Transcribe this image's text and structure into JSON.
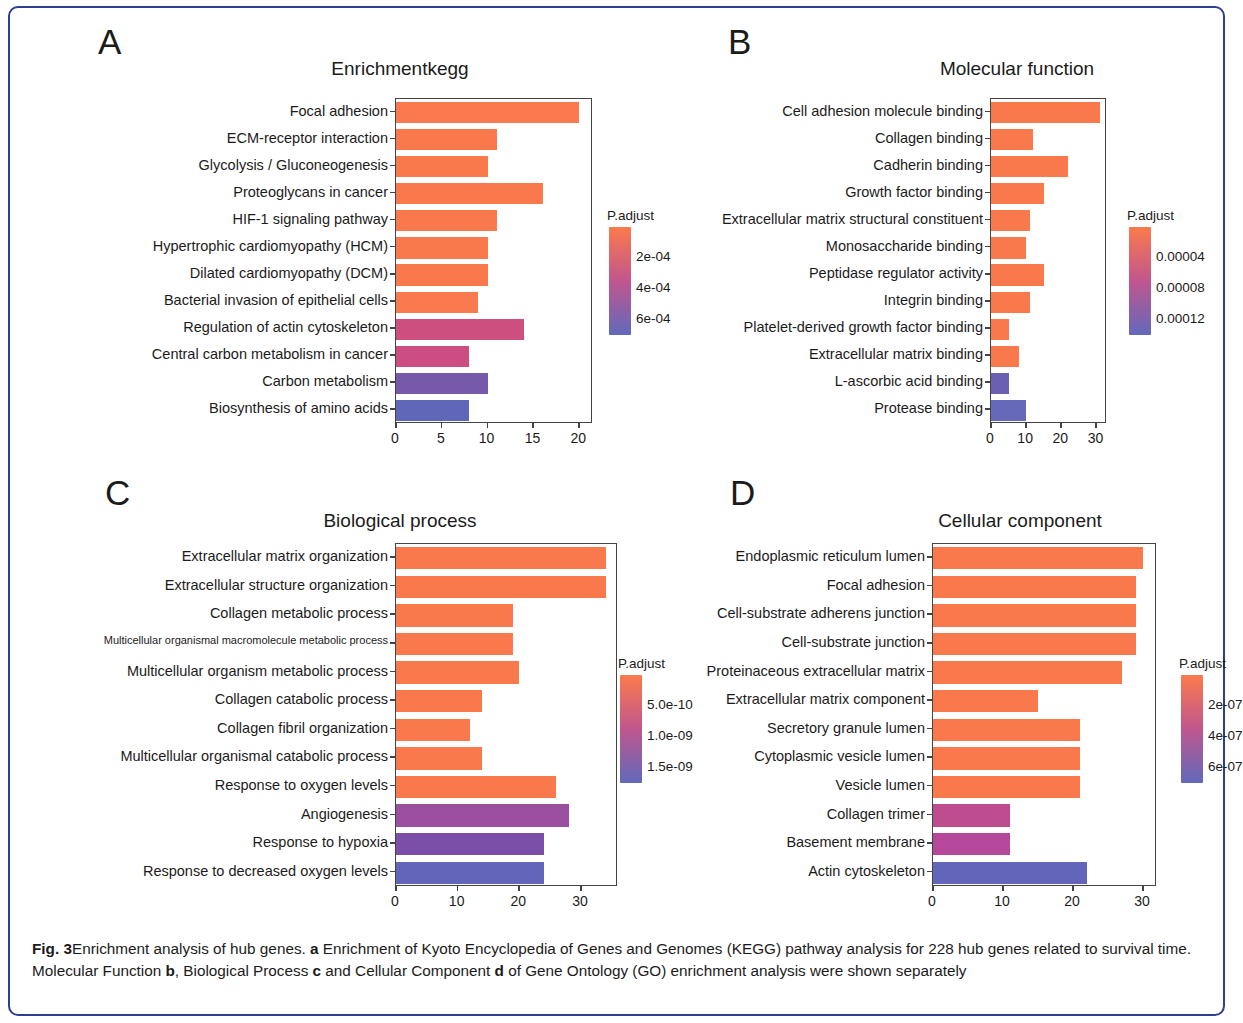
{
  "figure": {
    "caption_lead": "Fig. 3",
    "caption_text_1": "Enrichment analysis of hub genes. ",
    "caption_a": "a",
    "caption_text_2": " Enrichment of Kyoto Encyclopedia of Genes and Genomes (KEGG) pathway analysis for 228 hub genes related to survival time. Molecular Function ",
    "caption_b": "b",
    "caption_text_3": ", Biological Process ",
    "caption_c": "c",
    "caption_text_4": " and Cellular Component ",
    "caption_d": "d",
    "caption_text_5": " of Gene Ontology (GO) enrichment analysis were shown separately"
  },
  "panels": {
    "a": {
      "letter": "A",
      "title": "Enrichmentkegg"
    },
    "b": {
      "letter": "B",
      "title": "Molecular function"
    },
    "c": {
      "letter": "C",
      "title": "Biological process"
    },
    "d": {
      "letter": "D",
      "title": "Cellular component"
    }
  },
  "chart_data": [
    {
      "id": "a",
      "type": "bar",
      "orientation": "horizontal",
      "title": "Enrichmentkegg",
      "xlabel": "",
      "ylabel": "",
      "xlim": [
        0,
        21.5
      ],
      "xticks": [
        0,
        5,
        10,
        15,
        20
      ],
      "xticklabels": [
        "0",
        "5",
        "10",
        "15",
        "20"
      ],
      "grid": false,
      "categories": [
        "Focal adhesion",
        "ECM-receptor interaction",
        "Glycolysis / Gluconeogenesis",
        "Proteoglycans in cancer",
        "HIF-1 signaling pathway",
        "Hypertrophic cardiomyopathy (HCM)",
        "Dilated cardiomyopathy (DCM)",
        "Bacterial invasion of epithelial cells",
        "Regulation of actin cytoskeleton",
        "Central carbon metabolism in cancer",
        "Carbon metabolism",
        "Biosynthesis of amino acids"
      ],
      "values": [
        20,
        11,
        10,
        16,
        11,
        10,
        10,
        9,
        14,
        8,
        10,
        8
      ],
      "colors": [
        "#f97a4e",
        "#f9794d",
        "#f9794d",
        "#f9794d",
        "#f9794d",
        "#f9794d",
        "#f9794d",
        "#f97a4e",
        "#cc4f7f",
        "#cc4e80",
        "#7659a8",
        "#6067b9"
      ],
      "legend": {
        "title": "P.adjust",
        "position": "right",
        "ticklabels": [
          "2e-04",
          "4e-04",
          "6e-04"
        ],
        "tickvalues": [
          0.0002,
          0.0004,
          0.0006
        ],
        "gradient_top": "#fb7a4b",
        "gradient_mid": "#c0568e",
        "gradient_bottom": "#6169bb"
      }
    },
    {
      "id": "b",
      "type": "bar",
      "orientation": "horizontal",
      "title": "Molecular function",
      "xlabel": "",
      "ylabel": "",
      "xlim": [
        0,
        33
      ],
      "xticks": [
        0,
        10,
        20,
        30
      ],
      "xticklabels": [
        "0",
        "10",
        "20",
        "30"
      ],
      "grid": false,
      "categories": [
        "Cell  adhesion molecule binding",
        "Collagen binding",
        "Cadherin binding",
        "Growth factor binding",
        "Extracellular matrix structural constituent",
        "Monosaccharide binding",
        "Peptidase regulator activity",
        "Integrin binding",
        "Platelet-derived growth factor binding",
        "Extracellular matrix binding",
        "L-ascorbic acid binding",
        "Protease binding"
      ],
      "values": [
        31,
        12,
        22,
        15,
        11,
        10,
        15,
        11,
        5,
        8,
        5,
        10
      ],
      "colors": [
        "#f9794d",
        "#f9794d",
        "#f9794d",
        "#f9794d",
        "#f9794d",
        "#f9794d",
        "#f9794d",
        "#f9794d",
        "#f9794d",
        "#f9794d",
        "#6a5fb0",
        "#6669b8"
      ],
      "legend": {
        "title": "P.adjust",
        "position": "right",
        "ticklabels": [
          "0.00004",
          "0.00008",
          "0.00012"
        ],
        "tickvalues": [
          4e-05,
          8e-05,
          0.00012
        ],
        "gradient_top": "#fb7a4b",
        "gradient_mid": "#c0568e",
        "gradient_bottom": "#6169bb"
      }
    },
    {
      "id": "c",
      "type": "bar",
      "orientation": "horizontal",
      "title": "Biological process",
      "xlabel": "",
      "ylabel": "",
      "xlim": [
        0,
        36
      ],
      "xticks": [
        0,
        10,
        20,
        30
      ],
      "xticklabels": [
        "0",
        "10",
        "20",
        "30"
      ],
      "grid": false,
      "categories": [
        "Extracellular matrix organization",
        "Extracellular structure organization",
        "Collagen metabolic process",
        "Multicellular organismal macromolecule metabolic process",
        "Multicellular organism metabolic process",
        "Collagen catabolic process",
        "Collagen fibril organization",
        "Multicellular organismal catabolic process",
        "Response to oxygen levels",
        "Angiogenesis",
        "Response to hypoxia",
        "Response to decreased oxygen levels"
      ],
      "values": [
        34,
        34,
        19,
        19,
        20,
        14,
        12,
        14,
        26,
        28,
        24,
        24
      ],
      "colors": [
        "#f9794d",
        "#f9794d",
        "#f9794d",
        "#f9794d",
        "#f9794d",
        "#f9794d",
        "#f9794d",
        "#f9794d",
        "#f9794d",
        "#9b4fa0",
        "#7b4ea8",
        "#6265ba"
      ],
      "legend": {
        "title": "P.adjust",
        "position": "right",
        "ticklabels": [
          "5.0e-10",
          "1.0e-09",
          "1.5e-09"
        ],
        "tickvalues": [
          5e-10,
          1e-09,
          1.5e-09
        ],
        "gradient_top": "#fb7a4b",
        "gradient_mid": "#c0568e",
        "gradient_bottom": "#6169bb"
      }
    },
    {
      "id": "d",
      "type": "bar",
      "orientation": "horizontal",
      "title": "Cellular component",
      "xlabel": "",
      "ylabel": "",
      "xlim": [
        0,
        32
      ],
      "xticks": [
        0,
        10,
        20,
        30
      ],
      "xticklabels": [
        "0",
        "10",
        "20",
        "30"
      ],
      "grid": false,
      "categories": [
        "Endoplasmic reticulum lumen",
        "Focal adhesion",
        "Cell-substrate adherens junction",
        "Cell-substrate junction",
        "Proteinaceous extracellular matrix",
        "Extracellular matrix component",
        "Secretory granule lumen",
        "Cytoplasmic vesicle lumen",
        "Vesicle lumen",
        "Collagen trimer",
        "Basement membrane",
        "Actin cytoskeleton"
      ],
      "values": [
        30,
        29,
        29,
        29,
        27,
        15,
        21,
        21,
        21,
        11,
        11,
        22
      ],
      "colors": [
        "#f9794d",
        "#f9794d",
        "#f9794d",
        "#f9794d",
        "#f9794d",
        "#f9794d",
        "#f9794d",
        "#f9794d",
        "#f9794d",
        "#bd4d8d",
        "#b5489a",
        "#6265ba"
      ],
      "legend": {
        "title": "P.adjust",
        "position": "right",
        "ticklabels": [
          "2e-07",
          "4e-07",
          "6e-07"
        ],
        "tickvalues": [
          2e-07,
          4e-07,
          6e-07
        ],
        "gradient_top": "#fb7a4b",
        "gradient_mid": "#c0568e",
        "gradient_bottom": "#6169bb"
      }
    }
  ]
}
